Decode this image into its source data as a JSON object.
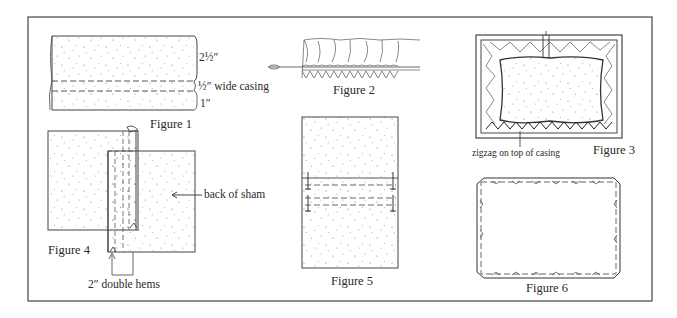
{
  "figures": {
    "fig1": {
      "caption": "Figure 1",
      "labels": {
        "top": "2½″",
        "casing": "½″ wide casing",
        "bottom": "1″"
      }
    },
    "fig2": {
      "caption": "Figure 2"
    },
    "fig3": {
      "caption": "Figure 3",
      "annotation": "zigzag on top of casing"
    },
    "fig4": {
      "caption": "Figure 4",
      "annotation_back": "back of sham",
      "annotation_hems": "2″ double hems"
    },
    "fig5": {
      "caption": "Figure 5"
    },
    "fig6": {
      "caption": "Figure 6"
    }
  },
  "colors": {
    "ink": "#333333",
    "paper": "#ffffff",
    "border": "#444444"
  }
}
